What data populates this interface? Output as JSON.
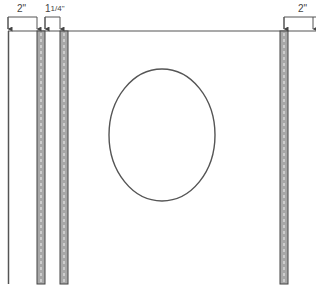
{
  "diagram": {
    "type": "sewing-pattern-layout",
    "colors": {
      "line": "#555555",
      "strip_fill": "#a8a8a8",
      "strip_edge": "#444444",
      "stitch": "#e6e6e6",
      "background": "#ffffff"
    },
    "dimensions": [
      {
        "id": "left-margin",
        "label": "2\"",
        "from_x": 8,
        "to_x": 37,
        "y": 20
      },
      {
        "id": "strip-spacing",
        "label": "1¼\"",
        "label_whole": "1",
        "label_fraction": "1/4\"",
        "from_x": 45,
        "to_x": 60,
        "y": 20
      },
      {
        "id": "right-margin",
        "label": "2\"",
        "from_x": 284,
        "to_x": 316,
        "y": 20
      }
    ],
    "panel": {
      "top_y": 31,
      "left_x": 8,
      "bottom_y": 284
    },
    "strips": [
      {
        "id": "strip-1",
        "x": 37,
        "width": 8
      },
      {
        "id": "strip-2",
        "x": 60,
        "width": 8
      },
      {
        "id": "strip-3",
        "x": 280,
        "width": 8
      }
    ],
    "oval": {
      "cx": 162,
      "cy": 135,
      "rx": 53,
      "ry": 66
    }
  }
}
